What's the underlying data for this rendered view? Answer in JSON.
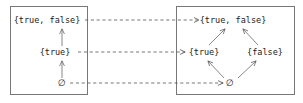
{
  "figure": {
    "width": 303,
    "height": 103,
    "background": "#ffffff",
    "line_color": "#555555",
    "border_color": "#777777",
    "text_color": "#1a1a1a"
  },
  "left_box": {
    "name": "chain-lattice-box",
    "x": 10,
    "y": 6,
    "width": 78,
    "height": 89,
    "nodes": [
      {
        "id": "top",
        "label": "{true, false}",
        "x": 47,
        "y": 20
      },
      {
        "id": "mid",
        "label": "{true}",
        "x": 55,
        "y": 52
      },
      {
        "id": "bot",
        "label": "∅",
        "x": 62,
        "y": 83
      }
    ],
    "edges": [
      {
        "from": "bot",
        "to": "mid",
        "style": "solid",
        "arrow": "up"
      },
      {
        "from": "mid",
        "to": "top",
        "style": "solid",
        "arrow": "up"
      }
    ]
  },
  "right_box": {
    "name": "diamond-lattice-box",
    "x": 176,
    "y": 6,
    "width": 119,
    "height": 89,
    "nodes": [
      {
        "id": "top",
        "label": "{true, false}",
        "x": 233,
        "y": 20
      },
      {
        "id": "left",
        "label": "{true}",
        "x": 204,
        "y": 52
      },
      {
        "id": "right",
        "label": "{false}",
        "x": 265,
        "y": 52
      },
      {
        "id": "bot",
        "label": "∅",
        "x": 230,
        "y": 83
      }
    ],
    "edges": [
      {
        "from": "bot",
        "to": "left",
        "style": "solid",
        "arrow": "up-left"
      },
      {
        "from": "bot",
        "to": "right",
        "style": "solid",
        "arrow": "up-right"
      },
      {
        "from": "left",
        "to": "top",
        "style": "solid",
        "arrow": "up-right"
      },
      {
        "from": "right",
        "to": "top",
        "style": "solid",
        "arrow": "up-left"
      }
    ]
  },
  "connectors": [
    {
      "id": "connector-top",
      "label": "",
      "from": "left.top",
      "to": "right.top",
      "style": "dashed",
      "y": 20,
      "x1": 85,
      "x2": 199
    },
    {
      "id": "connector-mid",
      "label": "",
      "from": "left.mid",
      "to": "right.left",
      "style": "dashed",
      "y": 52,
      "x1": 78,
      "x2": 185
    },
    {
      "id": "connector-bot",
      "label": "",
      "from": "left.bot",
      "to": "right.bot",
      "style": "dashed",
      "y": 83,
      "x1": 70,
      "x2": 223
    }
  ]
}
